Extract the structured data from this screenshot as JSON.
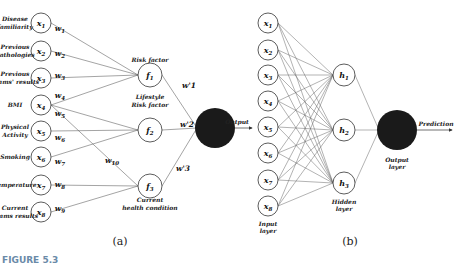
{
  "panel_a": {
    "inputs": [
      {
        "id": "x1",
        "label_lines": [
          "Disease",
          "familiarity"
        ],
        "weight": "w1"
      },
      {
        "id": "x2",
        "label_lines": [
          "Previous",
          "Pathologies"
        ],
        "weight": "w2"
      },
      {
        "id": "x3",
        "label_lines": [
          "Previous",
          "exams' results"
        ],
        "weight": "w3"
      },
      {
        "id": "x4",
        "label_lines": [
          "BMI"
        ],
        "weight": "w4"
      },
      {
        "id": "x5",
        "label_lines": [
          "Physical",
          "Activity"
        ],
        "weight": "w6"
      },
      {
        "id": "x6",
        "label_lines": [
          "Smoking"
        ],
        "weight": "w7"
      },
      {
        "id": "x7",
        "label_lines": [
          "Temperature"
        ],
        "weight": "w8"
      },
      {
        "id": "x8",
        "label_lines": [
          "Current",
          "exams  results"
        ],
        "weight": "w9"
      }
    ],
    "extra_weights": [
      "w5",
      "w10"
    ],
    "factors": [
      {
        "id": "f1",
        "label_lines": [
          "Risk factor"
        ],
        "out_weight": "w'1"
      },
      {
        "id": "f2",
        "label_lines": [
          "Lifestyle",
          "Risk factor"
        ],
        "out_weight": "w'2"
      },
      {
        "id": "f3",
        "label_lines": [
          "Current",
          "health condition"
        ],
        "out_weight": "w'3"
      }
    ],
    "output_label": "Output",
    "caption": "(a)"
  },
  "panel_b": {
    "inputs": [
      "x1",
      "x2",
      "x3",
      "x4",
      "x5",
      "x6",
      "x7",
      "x8"
    ],
    "hidden": [
      "h1",
      "h2",
      "h3"
    ],
    "input_layer_label": [
      "Input",
      "layer"
    ],
    "hidden_layer_label": [
      "Hidden",
      "layer"
    ],
    "output_layer_label": [
      "Output",
      "layer"
    ],
    "output_label": "Prediction",
    "caption": "(b)"
  },
  "figure_label": "FIGURE 5.3",
  "colors": {
    "node_fill": "#1a1a1a",
    "line": "#666666",
    "figure_label": "#6a8aa8"
  }
}
